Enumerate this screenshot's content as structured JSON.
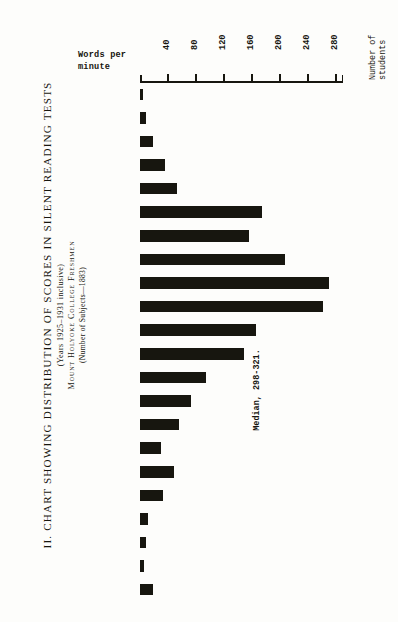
{
  "title": {
    "main": "II.  CHART  SHOWING  DISTRIBUTION  OF  SCORES  IN  SILENT  READING  TESTS",
    "sub1": "(Years 1925–1931 inclusive)",
    "sub2": "Mount  Holyoke  College  Freshmen",
    "sub3": "(Number of Subjects—1883)"
  },
  "axes": {
    "value_axis_title_line1": "Number of",
    "value_axis_title_line2": "students",
    "category_axis_title_line1": "Words per",
    "category_axis_title_line2": "minute",
    "tick_labels": [
      "40",
      "80",
      "120",
      "160",
      "200",
      "240",
      "280"
    ],
    "xlim_min": 0,
    "xlim_max": 290
  },
  "annotation": {
    "median_text": "Median, 298-321."
  },
  "chart_data": {
    "type": "bar",
    "orientation": "horizontal",
    "title": "II. CHART SHOWING DISTRIBUTION OF SCORES IN SILENT READING TESTS",
    "subtitle": "Mount Holyoke College Freshmen (Years 1925-1931 inclusive) (Number of Subjects—1883)",
    "xlabel": "Number of students",
    "ylabel": "Words per minute",
    "xlim": [
      0,
      290
    ],
    "xticks": [
      40,
      80,
      120,
      160,
      200,
      240,
      280
    ],
    "grid": false,
    "legend": null,
    "bar_color": "#17160f",
    "categories": [
      "82-105",
      "106-129",
      "130-153",
      "154-177",
      "178-201",
      "202-225",
      "226-249",
      "250-273",
      "274-297",
      "298-321",
      "322-345",
      "346-369",
      "370-393",
      "394-417",
      "418-441",
      "442-465",
      "466-489",
      "490-513",
      "514-537",
      "538-561",
      "562-585",
      "586-609"
    ],
    "values": [
      4,
      8,
      18,
      35,
      53,
      174,
      155,
      207,
      270,
      262,
      166,
      148,
      94,
      73,
      56,
      30,
      49,
      33,
      11,
      8,
      5,
      19
    ],
    "annotations": [
      {
        "text": "Median, 298-321.",
        "category": "418-441"
      }
    ]
  }
}
